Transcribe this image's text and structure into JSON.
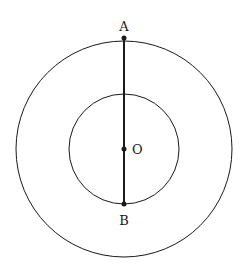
{
  "diagram": {
    "type": "concentric-circles",
    "center": {
      "label": "O",
      "x": 124,
      "y": 149
    },
    "outer_circle": {
      "r": 108
    },
    "inner_circle": {
      "r": 55
    },
    "segment": {
      "from": "A",
      "to": "B"
    },
    "points": [
      {
        "label": "A",
        "x": 124,
        "y": 37
      },
      {
        "label": "O",
        "x": 124,
        "y": 149
      },
      {
        "label": "B",
        "x": 124,
        "y": 204
      }
    ],
    "labels": {
      "a": "A",
      "o": "O",
      "b": "B"
    },
    "stroke_color": "#1a1a1a"
  }
}
